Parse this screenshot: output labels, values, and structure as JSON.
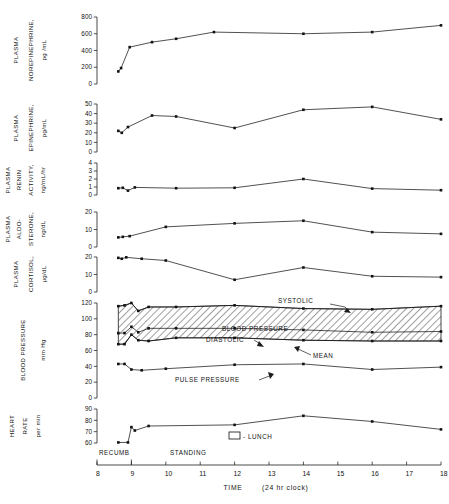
{
  "figure": {
    "x_axis": {
      "title": "TIME",
      "units": "(24 hr clock)",
      "ticks": [
        "8",
        "9",
        "10",
        "11",
        "12",
        "13",
        "14",
        "15",
        "16",
        "17",
        "18"
      ],
      "min": 8,
      "max": 18
    },
    "posture_annotations": [
      {
        "label": "RECUMB",
        "name": "recumbent-annotation"
      },
      {
        "label": "STANDING",
        "name": "standing-annotation"
      }
    ],
    "legend": {
      "symbol": "open-rectangle",
      "label": "- LUNCH"
    },
    "bp_annotations": [
      {
        "label": "SYSTOLIC",
        "name": "systolic-annotation"
      },
      {
        "label": "BLOOD PRESSURE",
        "name": "blood-pressure-annotation"
      },
      {
        "label": "DIASTOLIC",
        "name": "diastolic-annotation"
      },
      {
        "label": "MEAN",
        "name": "mean-annotation"
      }
    ],
    "pulse_annotation": {
      "label": "PULSE PRESSURE"
    }
  },
  "chart_data": {
    "type": "line",
    "title": "",
    "xlabel": "TIME (24 hr clock)",
    "x": [
      8.6,
      8.8,
      9.0,
      9.2,
      9.5,
      10.0,
      11.3,
      12.0,
      14.0,
      16.0,
      18.0
    ],
    "xlim": [
      8,
      18
    ],
    "grid": false,
    "legend": "none",
    "panels": [
      {
        "name": "plasma-norepinephrine",
        "ylabel": "PLASMA NOREPINEPHRINE, pg /mL",
        "ylabel_lines": [
          "PLASMA",
          "NOREPINEPHRINE,",
          "pg /mL"
        ],
        "ylim": [
          0,
          800
        ],
        "yticks": [
          0,
          200,
          400,
          600,
          800
        ],
        "x": [
          8.62,
          8.7,
          8.95,
          9.6,
          10.3,
          11.4,
          14.0,
          16.0,
          18.0
        ],
        "values": [
          150,
          190,
          440,
          500,
          540,
          620,
          600,
          620,
          700
        ]
      },
      {
        "name": "plasma-epinephrine",
        "ylabel": "PLASMA EPINEPHRINE, pg/mL",
        "ylabel_lines": [
          "PLASMA",
          "EPINEPHRINE,",
          "pg/mL"
        ],
        "ylim": [
          0,
          50
        ],
        "yticks": [
          0,
          10,
          20,
          30,
          40,
          50
        ],
        "x": [
          8.62,
          8.72,
          8.9,
          9.6,
          10.3,
          12.0,
          14.0,
          16.0,
          18.0
        ],
        "values": [
          22,
          20,
          26,
          38,
          37,
          25,
          44,
          47,
          34
        ]
      },
      {
        "name": "plasma-renin-activity",
        "ylabel": "PLASMA RENIN ACTIVITY, ng/mL/hr",
        "ylabel_lines": [
          "PLASMA",
          "RENIN",
          "ACTIVITY,",
          "ng/mL/hr"
        ],
        "ylim": [
          0,
          4
        ],
        "yticks": [
          0,
          1,
          2,
          3,
          4
        ],
        "x": [
          8.62,
          8.75,
          8.9,
          9.1,
          10.3,
          12.0,
          14.0,
          16.0,
          18.0
        ],
        "values": [
          0.85,
          0.9,
          0.55,
          0.95,
          0.85,
          0.9,
          2.0,
          0.8,
          0.6
        ]
      },
      {
        "name": "plasma-aldosterone",
        "ylabel": "PLASMA ALDO-STERONE, ng/dL",
        "ylabel_lines": [
          "PLASMA",
          "ALDO-",
          "STERONE,",
          "ng/dL"
        ],
        "ylim": [
          0,
          20
        ],
        "yticks": [
          0,
          10,
          20
        ],
        "x": [
          8.62,
          8.75,
          8.95,
          10.0,
          12.0,
          14.0,
          16.0,
          18.0
        ],
        "values": [
          5.5,
          5.8,
          6.2,
          11.5,
          13.5,
          15.0,
          8.5,
          7.5
        ]
      },
      {
        "name": "plasma-cortisol",
        "ylabel": "PLASMA CORTISOL, µg/dL",
        "ylabel_lines": [
          "PLASMA",
          "CORTISOL,",
          "µg/dL"
        ],
        "ylim": [
          0,
          20
        ],
        "yticks": [
          0,
          10,
          20
        ],
        "x": [
          8.62,
          8.72,
          8.85,
          9.3,
          10.0,
          12.0,
          14.0,
          16.0,
          18.0
        ],
        "values": [
          19.5,
          19.0,
          19.8,
          19.0,
          18.0,
          7.0,
          14.0,
          9.0,
          8.5
        ]
      },
      {
        "name": "blood-pressure",
        "ylabel": "BLOOD PRESSURE mm Hg",
        "ylabel_lines": [
          "BLOOD PRESSURE",
          "mm Hg"
        ],
        "ylim": [
          0,
          120
        ],
        "yticks": [
          0,
          20,
          40,
          60,
          80,
          100,
          120
        ],
        "series": [
          {
            "name": "systolic",
            "x": [
              8.62,
              8.8,
              9.0,
              9.2,
              9.5,
              10.3,
              12.0,
              14.0,
              16.0,
              18.0
            ],
            "values": [
              116,
              117,
              120,
              110,
              115,
              115,
              117,
              113,
              112,
              116
            ]
          },
          {
            "name": "mean",
            "x": [
              8.62,
              8.8,
              9.0,
              9.2,
              9.5,
              10.3,
              12.0,
              14.0,
              16.0,
              18.0
            ],
            "values": [
              82,
              82,
              90,
              83,
              88,
              88,
              88,
              86,
              83,
              84
            ]
          },
          {
            "name": "diastolic",
            "x": [
              8.62,
              8.8,
              9.0,
              9.2,
              9.5,
              10.3,
              12.0,
              14.0,
              16.0,
              18.0
            ],
            "values": [
              68,
              68,
              80,
              73,
              72,
              76,
              76,
              73,
              72,
              72
            ]
          }
        ]
      },
      {
        "name": "pulse-pressure",
        "ylabel": "",
        "ylim": [
          0,
          120
        ],
        "x": [
          8.62,
          8.8,
          9.0,
          9.3,
          10.0,
          12.0,
          14.0,
          16.0,
          18.0
        ],
        "values": [
          43,
          43,
          36,
          35,
          37,
          42,
          43,
          36,
          39
        ]
      },
      {
        "name": "heart-rate",
        "ylabel": "HEART RATE per min",
        "ylabel_lines": [
          "HEART",
          "RATE",
          "per min"
        ],
        "ylim": [
          60,
          90
        ],
        "yticks": [
          60,
          70,
          80,
          90
        ],
        "x": [
          8.62,
          8.9,
          9.0,
          9.1,
          9.5,
          12.0,
          14.0,
          16.0,
          18.0
        ],
        "values": [
          60.5,
          60.5,
          74,
          71,
          75,
          76,
          84,
          79,
          72
        ]
      }
    ]
  }
}
